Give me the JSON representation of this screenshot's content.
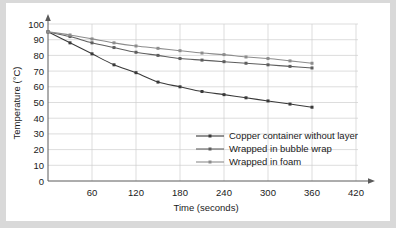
{
  "chart_data": {
    "type": "line",
    "title": "",
    "xlabel": "Time (seconds)",
    "ylabel": "Temperature (°C)",
    "xlim": [
      0,
      420
    ],
    "ylim": [
      0,
      100
    ],
    "xticks": [
      60,
      120,
      180,
      240,
      300,
      360,
      420
    ],
    "yticks": [
      0,
      10,
      20,
      30,
      40,
      50,
      60,
      70,
      80,
      90,
      100
    ],
    "grid": true,
    "legend_position": "inside-bottom-right",
    "x": [
      0,
      30,
      60,
      90,
      120,
      150,
      180,
      210,
      240,
      270,
      300,
      330,
      360
    ],
    "series": [
      {
        "name": "Copper container without layer",
        "color": "#3a3a3a",
        "marker": "square",
        "values": [
          95,
          88,
          81,
          74,
          69,
          63,
          60,
          57,
          55,
          53,
          51,
          49,
          47
        ]
      },
      {
        "name": "Wrapped  in bubble wrap",
        "color": "#5e5e5e",
        "marker": "square",
        "values": [
          95,
          92,
          88,
          85,
          82,
          80,
          78,
          77,
          76,
          75,
          74,
          73,
          72
        ]
      },
      {
        "name": "Wrapped in foam",
        "color": "#8c8c8c",
        "marker": "square",
        "values": [
          95,
          93,
          90.5,
          88,
          86,
          84.5,
          83,
          81.5,
          80.5,
          79,
          78,
          76.5,
          75
        ]
      }
    ]
  },
  "axis": {
    "y_title": "Temperature (°C)",
    "x_title": "Time (seconds)",
    "y_labels": [
      "100",
      "90",
      "80",
      "70",
      "60",
      "50",
      "40",
      "30",
      "20",
      "10",
      "0"
    ],
    "x_labels": [
      "60",
      "120",
      "180",
      "240",
      "300",
      "360",
      "420"
    ]
  },
  "legend": {
    "items": [
      {
        "label": "Copper container without layer",
        "color": "#3a3a3a"
      },
      {
        "label": "Wrapped  in bubble wrap",
        "color": "#5e5e5e"
      },
      {
        "label": "Wrapped in foam",
        "color": "#8c8c8c"
      }
    ]
  }
}
